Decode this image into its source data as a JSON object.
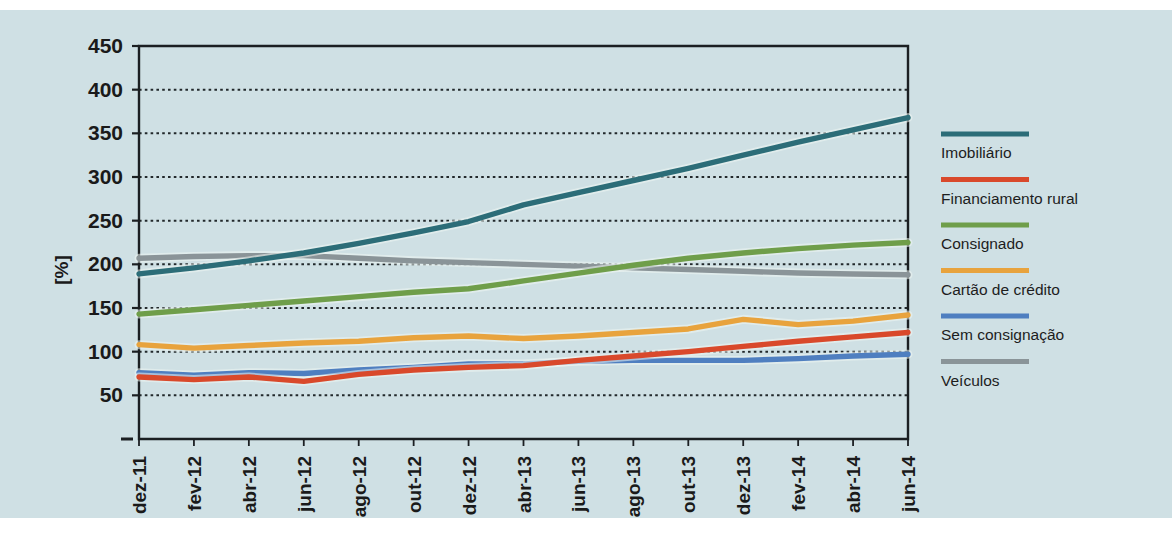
{
  "chart_data": {
    "type": "line",
    "title": "",
    "subtitle": "",
    "xlabel": "",
    "ylabel": "[%]",
    "ylim": [
      0,
      450
    ],
    "yticks": [
      50,
      100,
      150,
      200,
      250,
      300,
      350,
      400,
      450
    ],
    "ytick_labels": [
      "50",
      "100",
      "150",
      "200",
      "250",
      "300",
      "350",
      "400",
      "450"
    ],
    "grid": true,
    "grid_style": "dotted-horizontal",
    "legend_position": "right",
    "background_color": "#cfe0e4",
    "x": [
      "dez-11",
      "fev-12",
      "abr-12",
      "jun-12",
      "ago-12",
      "out-12",
      "dez-12",
      "abr-13",
      "jun-13",
      "ago-13",
      "out-13",
      "dez-13",
      "fev-14",
      "abr-14",
      "jun-14"
    ],
    "categories": [
      "dez-11",
      "fev-12",
      "abr-12",
      "jun-12",
      "ago-12",
      "out-12",
      "dez-12",
      "abr-13",
      "jun-13",
      "ago-13",
      "out-13",
      "dez-13",
      "fev-14",
      "abr-14",
      "jun-14"
    ],
    "series": [
      {
        "name": "Imobiliário",
        "color": "#2c6d78",
        "values": [
          189,
          196,
          204,
          213,
          224,
          236,
          249,
          268,
          282,
          296,
          310,
          325,
          340,
          354,
          368
        ]
      },
      {
        "name": "Financiamento rural",
        "color": "#d9492b",
        "values": [
          71,
          68,
          71,
          66,
          74,
          79,
          82,
          84,
          90,
          95,
          100,
          106,
          112,
          117,
          122
        ]
      },
      {
        "name": "Consignado",
        "color": "#6f9e4a",
        "values": [
          143,
          148,
          153,
          158,
          163,
          168,
          172,
          181,
          190,
          199,
          207,
          213,
          218,
          222,
          225
        ]
      },
      {
        "name": "Cartão de crédito",
        "color": "#e8a33d",
        "values": [
          108,
          104,
          107,
          110,
          112,
          116,
          118,
          115,
          118,
          122,
          126,
          137,
          131,
          135,
          142
        ]
      },
      {
        "name": "Sem consignação",
        "color": "#4f7fc0",
        "values": [
          76,
          73,
          76,
          75,
          79,
          82,
          86,
          86,
          89,
          90,
          90,
          90,
          92,
          95,
          97
        ]
      },
      {
        "name": "Veículos",
        "color": "#8a9498",
        "values": [
          207,
          209,
          210,
          210,
          207,
          204,
          202,
          200,
          198,
          196,
          194,
          192,
          190,
          189,
          188
        ]
      }
    ]
  },
  "legend": {
    "items": [
      {
        "label": "Imobiliário",
        "color": "#2c6d78"
      },
      {
        "label": "Financiamento rural",
        "color": "#d9492b"
      },
      {
        "label": "Consignado",
        "color": "#6f9e4a"
      },
      {
        "label": "Cartão de crédito",
        "color": "#e8a33d"
      },
      {
        "label": "Sem consignação",
        "color": "#4f7fc0"
      },
      {
        "label": "Veículos",
        "color": "#8a9498"
      }
    ]
  },
  "axes": {
    "y_axis_title": "[%]",
    "y_tick_labels": [
      "450",
      "400",
      "350",
      "300",
      "250",
      "200",
      "150",
      "100",
      "50"
    ],
    "x_tick_labels": [
      "dez-11",
      "fev-12",
      "abr-12",
      "jun-12",
      "ago-12",
      "out-12",
      "dez-12",
      "abr-13",
      "jun-13",
      "ago-13",
      "out-13",
      "dez-13",
      "fev-14",
      "abr-14",
      "jun-14"
    ],
    "origin_tick": "–"
  }
}
